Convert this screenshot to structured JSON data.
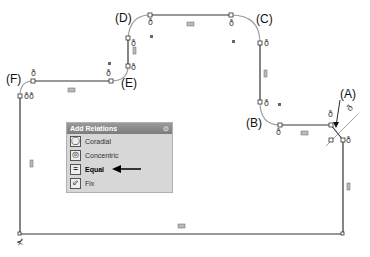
{
  "callouts": {
    "a": "(A)",
    "b": "(B)",
    "c": "(C)",
    "d": "(D)",
    "e": "(E)",
    "f": "(F)"
  },
  "panel": {
    "title": "Add Relations",
    "close_icon": "pin-icon",
    "items": [
      {
        "label": "Coradial",
        "icon": "coradial-icon"
      },
      {
        "label": "Concentric",
        "icon": "concentric-icon"
      },
      {
        "label": "Equal",
        "icon": "equal-icon",
        "highlighted": true
      },
      {
        "label": "Fix",
        "icon": "fix-icon"
      }
    ]
  },
  "markers": {
    "horizontal_symbol": "=",
    "vertical_symbol": "I"
  },
  "colors": {
    "sketch_line": "#333333",
    "arc_line": "#999999",
    "panel_bg": "#d7d7d7",
    "panel_header": "#8a8a8a"
  }
}
